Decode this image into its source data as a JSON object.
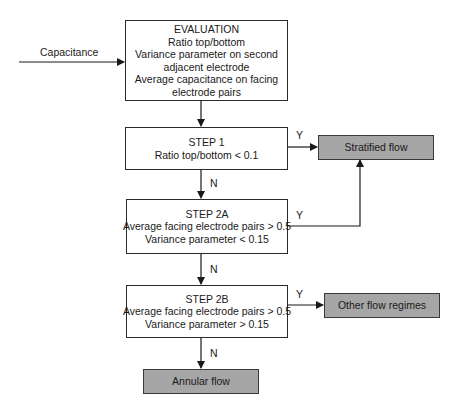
{
  "diagram": {
    "input_label": "Capacitance",
    "evaluation": {
      "title": "EVALUATION",
      "lines": [
        "Ratio top/bottom",
        "Variance parameter on second",
        "adjacent electrode",
        "Average capacitance on facing",
        "electrode pairs"
      ]
    },
    "step1": {
      "title": "STEP 1",
      "lines": [
        "Ratio top/bottom < 0.1"
      ]
    },
    "step2a": {
      "title": "STEP 2A",
      "lines": [
        "Average facing electrode pairs > 0.5",
        "Variance parameter < 0.15"
      ]
    },
    "step2b": {
      "title": "STEP 2B",
      "lines": [
        "Average facing electrode pairs > 0.5",
        "Variance parameter > 0.15"
      ]
    },
    "outcomes": {
      "stratified": "Stratified flow",
      "other": "Other flow regimes",
      "annular": "Annular flow"
    },
    "edge_labels": {
      "yes": "Y",
      "no": "N"
    },
    "colors": {
      "outcome_fill": "#a6a6a6",
      "line": "#2a2a2a"
    }
  }
}
